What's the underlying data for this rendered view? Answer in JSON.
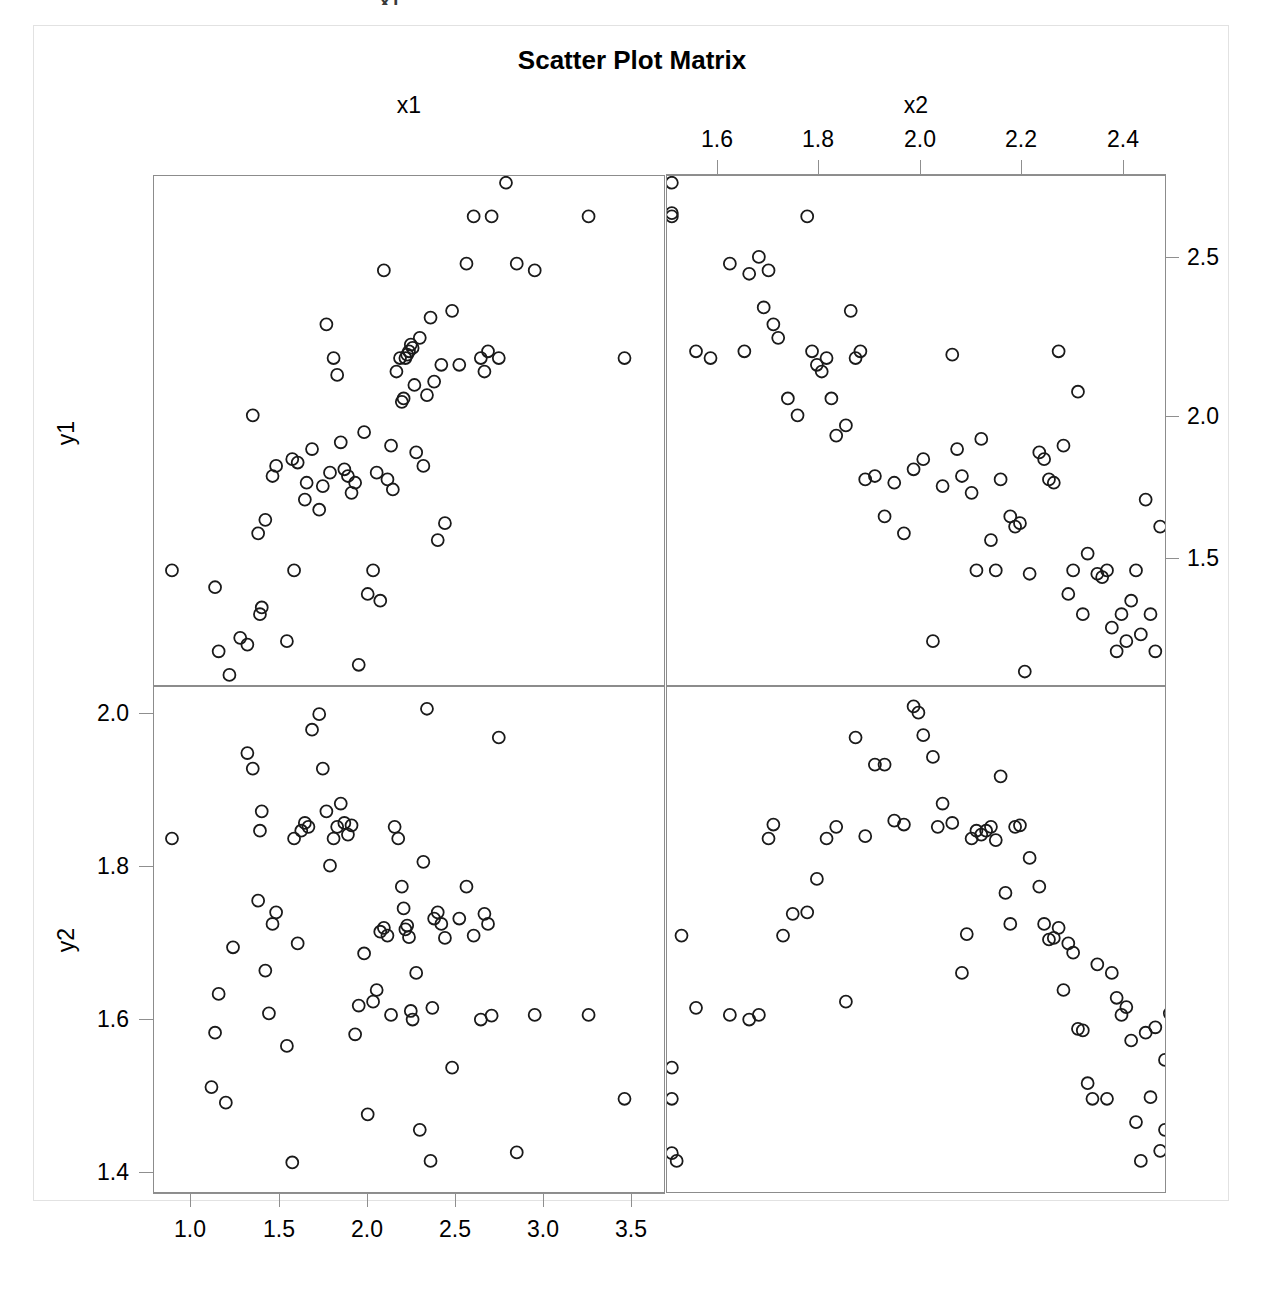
{
  "figure": {
    "title": "Scatter Plot Matrix",
    "top_partial_text": "x1",
    "variables": [
      "x1",
      "x2",
      "y1",
      "y2"
    ],
    "column_labels": [
      "x1",
      "x2"
    ],
    "row_labels": [
      "y1",
      "y2"
    ]
  },
  "axes": {
    "x1": {
      "label": "x1",
      "position": "bottom",
      "ticks": [
        "1.0",
        "1.5",
        "2.0",
        "2.5",
        "3.0",
        "3.5"
      ],
      "tick_values": [
        1.0,
        1.5,
        2.0,
        2.5,
        3.0,
        3.5
      ],
      "range": [
        0.78,
        3.62
      ]
    },
    "x2": {
      "label": "x2",
      "position": "top",
      "ticks": [
        "1.6",
        "1.8",
        "2.0",
        "2.2",
        "2.4"
      ],
      "tick_values": [
        1.6,
        1.8,
        2.0,
        2.2,
        2.4
      ],
      "range": [
        1.49,
        2.52
      ]
    },
    "y1": {
      "label": "y1",
      "position": "right",
      "ticks": [
        "1.5",
        "2.0",
        "2.5"
      ],
      "tick_values": [
        1.5,
        2.0,
        2.5
      ],
      "range": [
        1.23,
        2.74
      ]
    },
    "y2": {
      "label": "y2",
      "position": "left",
      "ticks": [
        "1.4",
        "1.6",
        "1.8",
        "2.0"
      ],
      "tick_values": [
        1.4,
        1.6,
        1.8,
        2.0
      ],
      "range": [
        1.39,
        2.04
      ]
    }
  },
  "style": {
    "marker": "open-circle",
    "marker_color": "#1a1a1a",
    "marker_radius": 6,
    "panel_border_color": "#8c8c8c",
    "background": "#ffffff",
    "grid": false
  },
  "chart_data": {
    "type": "scatter",
    "title": "Scatter Plot Matrix",
    "layout": "2x2 scatter plot matrix",
    "grid": false,
    "legend": null,
    "panels": [
      {
        "name": "y1-vs-x1",
        "row": 0,
        "col": 0,
        "xlabel": "x1",
        "ylabel": "y1",
        "xlim": [
          0.78,
          3.62
        ],
        "ylim": [
          1.23,
          2.74
        ],
        "x": [
          0.88,
          1.12,
          1.14,
          1.2,
          1.26,
          1.3,
          1.33,
          1.36,
          1.37,
          1.38,
          1.4,
          1.44,
          1.46,
          1.52,
          1.55,
          1.56,
          1.58,
          1.62,
          1.63,
          1.66,
          1.7,
          1.72,
          1.74,
          1.76,
          1.78,
          1.8,
          1.82,
          1.84,
          1.86,
          1.88,
          1.9,
          1.92,
          1.95,
          1.97,
          2.0,
          2.02,
          2.04,
          2.06,
          2.08,
          2.1,
          2.11,
          2.13,
          2.15,
          2.16,
          2.17,
          2.18,
          2.19,
          2.2,
          2.21,
          2.22,
          2.23,
          2.24,
          2.26,
          2.28,
          2.3,
          2.32,
          2.34,
          2.36,
          2.38,
          2.4,
          2.44,
          2.48,
          2.52,
          2.56,
          2.6,
          2.62,
          2.64,
          2.66,
          2.7,
          2.74,
          2.8,
          2.9,
          3.2,
          3.4
        ],
        "y": [
          1.57,
          1.52,
          1.33,
          1.26,
          1.37,
          1.35,
          2.03,
          1.68,
          1.44,
          1.46,
          1.72,
          1.85,
          1.88,
          1.36,
          1.9,
          1.57,
          1.89,
          1.78,
          1.83,
          1.93,
          1.75,
          1.82,
          2.3,
          1.86,
          2.2,
          2.15,
          1.95,
          1.87,
          1.85,
          1.8,
          1.83,
          1.29,
          1.98,
          1.5,
          1.57,
          1.86,
          1.48,
          2.46,
          1.84,
          1.94,
          1.81,
          2.16,
          2.2,
          2.07,
          2.08,
          2.2,
          2.21,
          2.22,
          2.24,
          2.23,
          2.12,
          1.92,
          2.26,
          1.88,
          2.09,
          2.32,
          2.13,
          1.66,
          2.18,
          1.71,
          2.34,
          2.18,
          2.48,
          2.62,
          2.2,
          2.16,
          2.22,
          2.62,
          2.2,
          2.72,
          2.48,
          2.46,
          2.62,
          2.2
        ]
      },
      {
        "name": "y1-vs-x2",
        "row": 0,
        "col": 1,
        "xlabel": "x2",
        "ylabel": "y1",
        "xlim": [
          1.49,
          2.52
        ],
        "ylim": [
          1.23,
          2.74
        ],
        "x": [
          1.5,
          1.5,
          1.5,
          1.55,
          1.58,
          1.62,
          1.65,
          1.66,
          1.68,
          1.69,
          1.7,
          1.71,
          1.72,
          1.74,
          1.76,
          1.78,
          1.79,
          1.8,
          1.81,
          1.82,
          1.83,
          1.84,
          1.86,
          1.87,
          1.88,
          1.89,
          1.9,
          1.92,
          1.94,
          1.96,
          1.98,
          2.0,
          2.02,
          2.04,
          2.06,
          2.08,
          2.09,
          2.1,
          2.12,
          2.13,
          2.14,
          2.16,
          2.17,
          2.18,
          2.2,
          2.21,
          2.22,
          2.23,
          2.24,
          2.26,
          2.27,
          2.28,
          2.29,
          2.3,
          2.31,
          2.32,
          2.33,
          2.34,
          2.35,
          2.36,
          2.38,
          2.39,
          2.4,
          2.41,
          2.42,
          2.43,
          2.44,
          2.45,
          2.46,
          2.47,
          2.48,
          2.49,
          2.5,
          2.51
        ],
        "y": [
          2.72,
          2.63,
          2.62,
          2.22,
          2.2,
          2.48,
          2.22,
          2.45,
          2.5,
          2.35,
          2.46,
          2.3,
          2.26,
          2.08,
          2.03,
          2.62,
          2.22,
          2.18,
          2.16,
          2.2,
          2.08,
          1.97,
          2.0,
          2.34,
          2.2,
          2.22,
          1.84,
          1.85,
          1.73,
          1.83,
          1.68,
          1.87,
          1.9,
          1.36,
          1.82,
          2.21,
          1.93,
          1.85,
          1.8,
          1.57,
          1.96,
          1.66,
          1.57,
          1.84,
          1.73,
          1.7,
          1.71,
          1.27,
          1.56,
          1.92,
          1.9,
          1.84,
          1.83,
          2.22,
          1.94,
          1.5,
          1.57,
          2.1,
          1.44,
          1.62,
          1.56,
          1.55,
          1.57,
          1.4,
          1.33,
          1.44,
          1.36,
          1.48,
          1.57,
          1.38,
          1.78,
          1.44,
          1.33,
          1.7
        ]
      },
      {
        "name": "y2-vs-x1",
        "row": 1,
        "col": 0,
        "xlabel": "x1",
        "ylabel": "y2",
        "xlim": [
          0.78,
          3.62
        ],
        "ylim": [
          1.39,
          2.04
        ],
        "x": [
          0.88,
          1.1,
          1.12,
          1.14,
          1.18,
          1.22,
          1.3,
          1.33,
          1.36,
          1.37,
          1.38,
          1.4,
          1.42,
          1.44,
          1.46,
          1.52,
          1.55,
          1.56,
          1.58,
          1.6,
          1.62,
          1.64,
          1.66,
          1.7,
          1.72,
          1.74,
          1.76,
          1.78,
          1.8,
          1.82,
          1.84,
          1.86,
          1.88,
          1.9,
          1.92,
          1.95,
          1.97,
          2.0,
          2.02,
          2.04,
          2.06,
          2.08,
          2.1,
          2.12,
          2.14,
          2.16,
          2.17,
          2.18,
          2.19,
          2.2,
          2.21,
          2.22,
          2.24,
          2.26,
          2.28,
          2.3,
          2.32,
          2.33,
          2.34,
          2.36,
          2.38,
          2.4,
          2.44,
          2.48,
          2.52,
          2.56,
          2.6,
          2.62,
          2.64,
          2.66,
          2.7,
          2.8,
          2.9,
          3.2,
          3.4
        ],
        "y": [
          1.845,
          1.525,
          1.595,
          1.645,
          1.505,
          1.705,
          1.955,
          1.935,
          1.765,
          1.855,
          1.88,
          1.675,
          1.62,
          1.735,
          1.75,
          1.578,
          1.428,
          1.845,
          1.71,
          1.855,
          1.865,
          1.86,
          1.985,
          2.005,
          1.935,
          1.88,
          1.81,
          1.845,
          1.86,
          1.89,
          1.865,
          1.85,
          1.862,
          1.593,
          1.63,
          1.697,
          1.49,
          1.635,
          1.65,
          1.725,
          1.73,
          1.72,
          1.618,
          1.86,
          1.845,
          1.783,
          1.755,
          1.728,
          1.733,
          1.718,
          1.623,
          1.612,
          1.672,
          1.47,
          1.815,
          2.012,
          1.43,
          1.627,
          1.742,
          1.75,
          1.735,
          1.717,
          1.55,
          1.742,
          1.783,
          1.72,
          1.612,
          1.748,
          1.735,
          1.617,
          1.975,
          1.441,
          1.618,
          1.618,
          1.51
        ]
      },
      {
        "name": "y2-vs-x2",
        "row": 1,
        "col": 1,
        "xlabel": "x2",
        "ylabel": "y2",
        "xlim": [
          1.49,
          2.52
        ],
        "ylim": [
          1.39,
          2.04
        ],
        "x": [
          1.5,
          1.5,
          1.5,
          1.51,
          1.52,
          1.55,
          1.62,
          1.66,
          1.68,
          1.7,
          1.71,
          1.73,
          1.75,
          1.78,
          1.8,
          1.82,
          1.84,
          1.86,
          1.88,
          1.9,
          1.92,
          1.94,
          1.96,
          1.98,
          2.0,
          2.01,
          2.02,
          2.04,
          2.05,
          2.06,
          2.08,
          2.1,
          2.11,
          2.12,
          2.13,
          2.14,
          2.15,
          2.16,
          2.17,
          2.18,
          2.19,
          2.2,
          2.21,
          2.22,
          2.24,
          2.26,
          2.27,
          2.28,
          2.29,
          2.3,
          2.31,
          2.32,
          2.33,
          2.34,
          2.35,
          2.36,
          2.37,
          2.38,
          2.4,
          2.41,
          2.42,
          2.43,
          2.44,
          2.45,
          2.46,
          2.47,
          2.48,
          2.49,
          2.5,
          2.51,
          2.52,
          2.52,
          2.53,
          2.54
        ],
        "y": [
          1.55,
          1.51,
          1.44,
          1.43,
          1.72,
          1.627,
          1.618,
          1.612,
          1.618,
          1.845,
          1.863,
          1.72,
          1.748,
          1.75,
          1.793,
          1.845,
          1.86,
          1.635,
          1.975,
          1.848,
          1.94,
          1.94,
          1.868,
          1.863,
          2.015,
          2.007,
          1.978,
          1.95,
          1.86,
          1.89,
          1.865,
          1.672,
          1.722,
          1.845,
          1.855,
          1.85,
          1.855,
          1.86,
          1.843,
          1.925,
          1.775,
          1.735,
          1.86,
          1.862,
          1.82,
          1.783,
          1.735,
          1.715,
          1.717,
          1.73,
          1.65,
          1.71,
          1.698,
          1.6,
          1.598,
          1.53,
          1.51,
          1.683,
          1.51,
          1.672,
          1.64,
          1.618,
          1.628,
          1.585,
          1.48,
          1.43,
          1.595,
          1.512,
          1.602,
          1.443,
          1.56,
          1.47,
          1.62,
          1.53
        ]
      }
    ]
  }
}
